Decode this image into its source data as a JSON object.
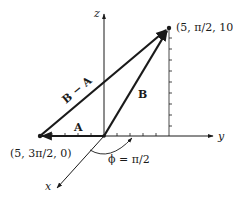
{
  "diagram": {
    "axes": {
      "x_label": "x",
      "y_label": "y",
      "z_label": "z"
    },
    "points": {
      "tip_label": "(5, π/2, 10)",
      "a_label": "(5, 3π/2, 0)"
    },
    "vectors": {
      "a_label": "A",
      "b_label": "B",
      "b_minus_a_label": "B − A"
    },
    "angle": {
      "label": "ϕ = π/2"
    },
    "colors": {
      "ink": "#1a1a1a",
      "background": "#ffffff"
    }
  }
}
